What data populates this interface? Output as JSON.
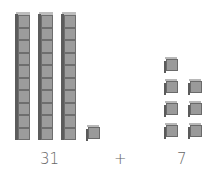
{
  "diagram": {
    "left_group": {
      "tens_rods": 3,
      "ones_cubes": 1,
      "value_label": "31"
    },
    "operator": "+",
    "right_group": {
      "ones_cubes": 7,
      "value_label": "7"
    },
    "colors": {
      "block_face": "#9c9c9c",
      "block_edge": "#6e6e6e",
      "block_side": "#5c5c5c",
      "label": "#666666"
    }
  }
}
